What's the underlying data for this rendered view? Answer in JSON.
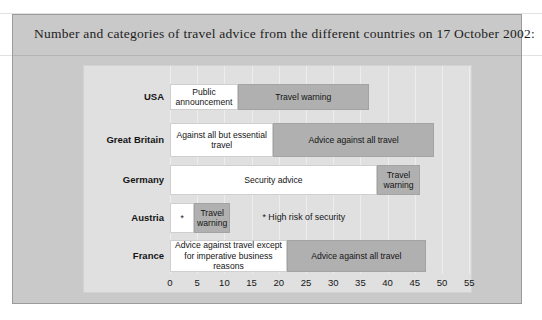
{
  "caption": {
    "text": "Number and categories of travel advice from the different countries on 17 October 2002:"
  },
  "chart_data": {
    "type": "bar",
    "orientation": "horizontal",
    "stacked": true,
    "title": "Number and categories of travel advice from the different countries on 17 October 2002:",
    "xlabel": "",
    "ylabel": "",
    "xlim": [
      0,
      55
    ],
    "xticks": [
      0,
      5,
      10,
      15,
      20,
      25,
      30,
      35,
      40,
      45,
      50,
      55
    ],
    "xtick_labels": [
      "0",
      "5",
      "10",
      "15",
      "20",
      "25",
      "30",
      "35",
      "40",
      "45",
      "50",
      "55"
    ],
    "grid": true,
    "legend": "none",
    "categories": [
      "USA",
      "Great Britain",
      "Germany",
      "Austria",
      "France"
    ],
    "series": [
      {
        "name": "Lower category",
        "color": "#ffffff",
        "values": [
          12.5,
          19,
          38,
          4.5,
          21.5
        ],
        "labels": [
          "Public announcement",
          "Against all but essential travel",
          "Security advice",
          "*",
          "Advice against travel except for imperative business reasons"
        ]
      },
      {
        "name": "Higher category",
        "color": "#b0b0b0",
        "values": [
          24,
          29.5,
          8,
          6.5,
          25.5
        ],
        "labels": [
          "Travel warning",
          "Advice against all travel",
          "Travel warning",
          "Travel warning",
          "Advice against all travel"
        ]
      }
    ],
    "totals": [
      36.5,
      48.5,
      46,
      11,
      47
    ],
    "annotations": [
      {
        "text": "* High risk of security",
        "category": "Austria",
        "x": 17
      }
    ]
  },
  "rows": [
    {
      "label": "USA",
      "segments": [
        {
          "kind": "white",
          "text": "Public announcement",
          "start": 0,
          "end": 12.5
        },
        {
          "kind": "grey",
          "text": "Travel warning",
          "start": 12.5,
          "end": 36.5
        }
      ]
    },
    {
      "label": "Great Britain",
      "segments": [
        {
          "kind": "white",
          "text": "Against all but essential travel",
          "start": 0,
          "end": 19
        },
        {
          "kind": "grey",
          "text": "Advice against all travel",
          "start": 19,
          "end": 48.5
        }
      ]
    },
    {
      "label": "Germany",
      "segments": [
        {
          "kind": "white",
          "text": "Security advice",
          "start": 0,
          "end": 38
        },
        {
          "kind": "grey",
          "text": "Travel warning",
          "start": 38,
          "end": 46
        }
      ]
    },
    {
      "label": "Austria",
      "segments": [
        {
          "kind": "white",
          "text": "*",
          "start": 0,
          "end": 4.5
        },
        {
          "kind": "grey",
          "text": "Travel warning",
          "start": 4.5,
          "end": 11
        }
      ],
      "footnote": "* High risk of security"
    },
    {
      "label": "France",
      "segments": [
        {
          "kind": "white",
          "text": "Advice against travel except for imperative business reasons",
          "start": 0,
          "end": 21.5
        },
        {
          "kind": "grey",
          "text": "Advice against all travel",
          "start": 21.5,
          "end": 47
        }
      ]
    }
  ],
  "axis": {
    "ticks": [
      "0",
      "5",
      "10",
      "15",
      "20",
      "25",
      "30",
      "35",
      "40",
      "45",
      "50",
      "55"
    ]
  }
}
